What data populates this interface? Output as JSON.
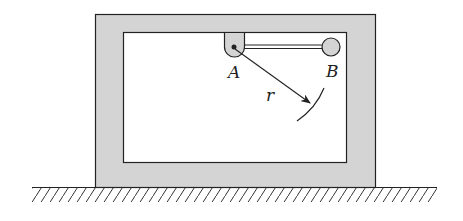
{
  "diagram": {
    "labels": {
      "pivot": "A",
      "mass": "B",
      "radius": "r"
    },
    "colors": {
      "frame_fill": "#d4d4d4",
      "stroke": "#222222",
      "background": "#ffffff"
    },
    "elements": [
      "outer-frame",
      "inner-cavity",
      "pivot-bracket-A",
      "rigid-rod",
      "ball-B",
      "radius-arrow-r",
      "arc-path",
      "ground-hatched"
    ]
  }
}
